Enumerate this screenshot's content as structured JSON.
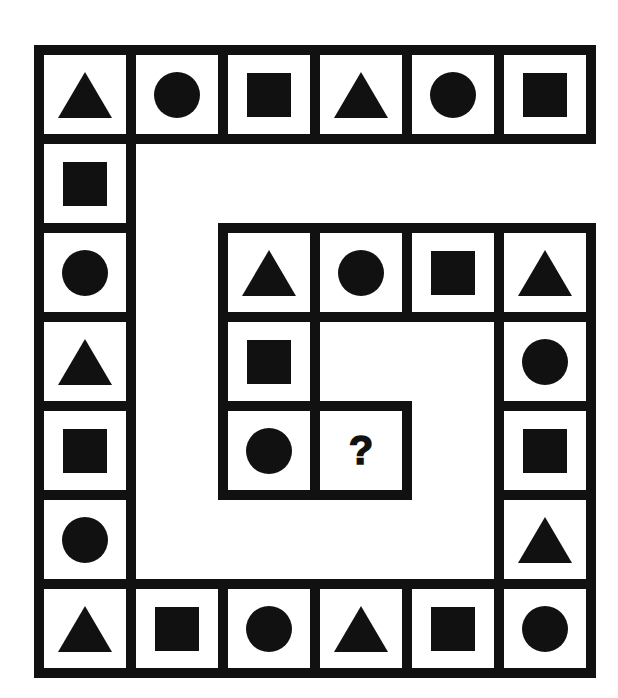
{
  "puzzle": {
    "question_mark": "?",
    "shape_color": "#111111",
    "border_color": "#111111",
    "background_color": "#ffffff",
    "grid": {
      "col_x": [
        34,
        126,
        218,
        310,
        402,
        494,
        586
      ],
      "row_y": [
        45,
        134,
        223,
        312,
        401,
        490,
        579,
        668
      ]
    },
    "cells": [
      {
        "row": 0,
        "col": 0,
        "shape": "triangle"
      },
      {
        "row": 0,
        "col": 1,
        "shape": "circle"
      },
      {
        "row": 0,
        "col": 2,
        "shape": "square"
      },
      {
        "row": 0,
        "col": 3,
        "shape": "triangle"
      },
      {
        "row": 0,
        "col": 4,
        "shape": "circle"
      },
      {
        "row": 0,
        "col": 5,
        "shape": "square"
      },
      {
        "row": 1,
        "col": 0,
        "shape": "square"
      },
      {
        "row": 2,
        "col": 0,
        "shape": "circle"
      },
      {
        "row": 3,
        "col": 0,
        "shape": "triangle"
      },
      {
        "row": 4,
        "col": 0,
        "shape": "square"
      },
      {
        "row": 5,
        "col": 0,
        "shape": "circle"
      },
      {
        "row": 6,
        "col": 0,
        "shape": "triangle"
      },
      {
        "row": 6,
        "col": 1,
        "shape": "square"
      },
      {
        "row": 6,
        "col": 2,
        "shape": "circle"
      },
      {
        "row": 6,
        "col": 3,
        "shape": "triangle"
      },
      {
        "row": 6,
        "col": 4,
        "shape": "square"
      },
      {
        "row": 6,
        "col": 5,
        "shape": "circle"
      },
      {
        "row": 5,
        "col": 5,
        "shape": "triangle"
      },
      {
        "row": 4,
        "col": 5,
        "shape": "square"
      },
      {
        "row": 3,
        "col": 5,
        "shape": "circle"
      },
      {
        "row": 2,
        "col": 5,
        "shape": "triangle"
      },
      {
        "row": 2,
        "col": 4,
        "shape": "square"
      },
      {
        "row": 2,
        "col": 3,
        "shape": "circle"
      },
      {
        "row": 2,
        "col": 2,
        "shape": "triangle"
      },
      {
        "row": 3,
        "col": 2,
        "shape": "square"
      },
      {
        "row": 4,
        "col": 2,
        "shape": "circle"
      },
      {
        "row": 4,
        "col": 3,
        "shape": "question"
      }
    ]
  }
}
